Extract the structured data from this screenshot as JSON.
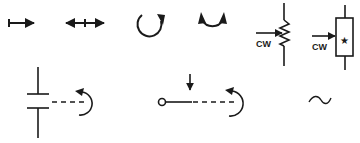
{
  "colors": {
    "stroke": "#1a1a1a",
    "background": "#ffffff"
  },
  "symbols": [
    {
      "id": "linear-motion-one-direction",
      "label": ""
    },
    {
      "id": "linear-motion-both-directions",
      "label": ""
    },
    {
      "id": "rotary-motion-one-direction",
      "label": ""
    },
    {
      "id": "rotary-motion-both-directions",
      "label": ""
    },
    {
      "id": "variable-resistor-cw",
      "label": "CW"
    },
    {
      "id": "variable-component-cw",
      "label": "CW",
      "marker": "★"
    },
    {
      "id": "variable-capacitor-rotary-control",
      "label": ""
    },
    {
      "id": "switch-contact-rotary-control",
      "label": ""
    },
    {
      "id": "alternating-current",
      "label": "~"
    }
  ]
}
